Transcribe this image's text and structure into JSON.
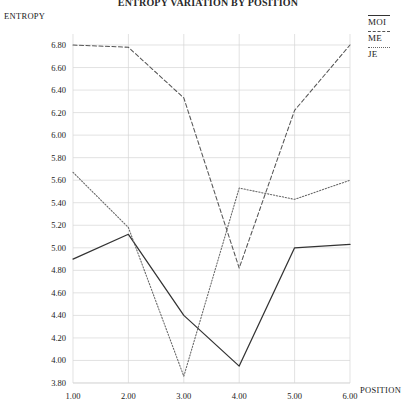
{
  "title": "ENTROPY VARIATION BY POSITION",
  "axes": {
    "y_label": "ENTROPY",
    "x_label": "POSITION",
    "y_ticks": [
      "3.80",
      "4.00",
      "4.20",
      "4.40",
      "4.60",
      "4.80",
      "5.00",
      "5.20",
      "5.40",
      "5.60",
      "5.80",
      "6.00",
      "6.20",
      "6.40",
      "6.60",
      "6.80"
    ],
    "x_ticks": [
      "1.00",
      "2.00",
      "3.00",
      "4.00",
      "5.00",
      "6.00"
    ]
  },
  "legend": {
    "position": "top-right",
    "entries": [
      {
        "label": "MOI",
        "style": "solid"
      },
      {
        "label": "ME",
        "style": "dashed"
      },
      {
        "label": "JE",
        "style": "dotted"
      }
    ]
  },
  "colors": {
    "moi": "#333333",
    "me": "#555555",
    "je": "#666666",
    "grid": "#d6d6d6",
    "text": "#1a1a1a"
  },
  "chart_data": {
    "type": "line",
    "title": "ENTROPY VARIATION BY POSITION",
    "xlabel": "POSITION",
    "ylabel": "ENTROPY",
    "x": [
      1.0,
      2.0,
      3.0,
      4.0,
      5.0,
      6.0
    ],
    "xlim": [
      1.0,
      6.0
    ],
    "ylim": [
      3.8,
      6.9
    ],
    "grid": true,
    "legend_position": "top-right",
    "series": [
      {
        "name": "MOI",
        "style": "solid",
        "values": [
          4.9,
          5.12,
          4.4,
          3.95,
          5.0,
          5.03
        ]
      },
      {
        "name": "ME",
        "style": "dashed",
        "values": [
          6.8,
          6.78,
          6.33,
          4.82,
          6.22,
          6.8
        ]
      },
      {
        "name": "JE",
        "style": "dotted",
        "values": [
          5.67,
          5.18,
          3.86,
          5.53,
          5.43,
          5.6
        ]
      }
    ]
  }
}
